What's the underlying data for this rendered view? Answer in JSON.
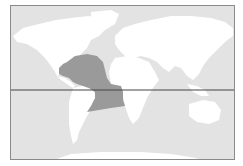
{
  "map": {
    "type": "range-map",
    "projection": "world",
    "colors": {
      "ocean": "#e3e3e3",
      "land": "#ffffff",
      "range": "#9a9a9a",
      "equator": "#444444",
      "border": "#8a8a8a"
    },
    "highlighted_region": "Tropical western Atlantic Ocean incl. Gulf of Mexico, Caribbean Sea and waters off northeast Brazil",
    "reference_lines": [
      "equator"
    ]
  }
}
